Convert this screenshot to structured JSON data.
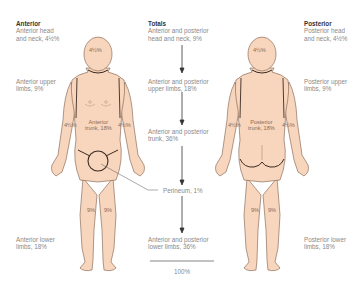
{
  "figure": {
    "columns": {
      "anterior": {
        "header": "Anterior",
        "head_neck": [
          "Anterior head",
          "and neck, 4½%"
        ],
        "upper_limbs": [
          "Anterior upper",
          "limbs, 9%"
        ],
        "lower_limbs": [
          "Anterior lower",
          "limbs, 18%"
        ]
      },
      "totals": {
        "header": "Totals",
        "head_neck": [
          "Anterior and posterior",
          "head and neck, 9%"
        ],
        "upper_limbs": [
          "Anterior and posterior",
          "upper limbs, 18%"
        ],
        "trunk": [
          "Anterior and posterior",
          "trunk, 36%"
        ],
        "perineum": "Perineum, 1%",
        "lower_limbs": [
          "Anterior and posterior",
          "lower limbs, 36%"
        ],
        "total": "100%"
      },
      "posterior": {
        "header": "Posterior",
        "head_neck": [
          "Posterior head",
          "and neck, 4½%"
        ],
        "upper_limbs": [
          "Posterior upper",
          "limbs, 9%"
        ],
        "lower_limbs": [
          "Posterior lower",
          "limbs, 18%"
        ]
      }
    },
    "front_body": {
      "head": "4½%",
      "left_arm": "4½%",
      "right_arm": "4½%",
      "trunk": [
        "Anterior",
        "trunk, 18%"
      ],
      "left_leg": "9%",
      "right_leg": "9%"
    },
    "back_body": {
      "head": "4½%",
      "left_arm": "4½%",
      "right_arm": "4½%",
      "trunk": [
        "Posterior",
        "trunk, 18%"
      ],
      "left_leg": "9%",
      "right_leg": "9%"
    },
    "colors": {
      "skin": "#f8d6bd",
      "outline": "#3a2a22",
      "text": "#8a8a8a",
      "header": "#333333"
    }
  }
}
